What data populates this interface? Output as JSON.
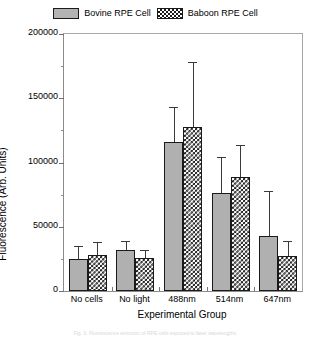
{
  "legend": {
    "position": "top-center",
    "entries": [
      {
        "label": "Bovine RPE Cell",
        "swatch": "solid-gray-swatch",
        "color": "#b3b3b3"
      },
      {
        "label": "Baboon RPE Cell",
        "swatch": "checkered-swatch",
        "color": "#1b1b1b"
      }
    ]
  },
  "axes": {
    "y_title": "Fluorescence (Arb. Units)",
    "x_title": "Experimental Group",
    "y_ticks": [
      "200000",
      "150000",
      "100000",
      "50000",
      "0"
    ]
  },
  "caption": {
    "text": "Fig. 3. Fluorescence emission of RPE cells exposed to laser wavelengths."
  },
  "chart_data": {
    "type": "bar",
    "title": "",
    "subtitle": "",
    "xlabel": "Experimental Group",
    "ylabel": "Fluorescence (Arb. Units)",
    "categories": [
      "No cells",
      "No light",
      "488nm",
      "514nm",
      "647nm"
    ],
    "ylim": [
      0,
      200000
    ],
    "yticks": [
      0,
      50000,
      100000,
      150000,
      200000
    ],
    "ytick_labels": [
      "0",
      "50000",
      "100000",
      "150000",
      "200000"
    ],
    "y_minor_ticks": [
      25000,
      75000,
      125000,
      175000
    ],
    "grid": false,
    "legend_position": "top-center",
    "error_bar_type": "upper-only",
    "series": [
      {
        "name": "Bovine RPE Cell",
        "fill": "solid-gray",
        "color": "#b0b0b0",
        "values": [
          25000,
          32000,
          116000,
          76000,
          43000
        ],
        "errors": [
          10000,
          7000,
          27000,
          28000,
          35000
        ]
      },
      {
        "name": "Baboon RPE Cell",
        "fill": "checkered",
        "color": "#1b1b1b",
        "values": [
          28000,
          26000,
          128000,
          89000,
          27000
        ],
        "errors": [
          10000,
          6000,
          50000,
          25000,
          12000
        ]
      }
    ]
  }
}
